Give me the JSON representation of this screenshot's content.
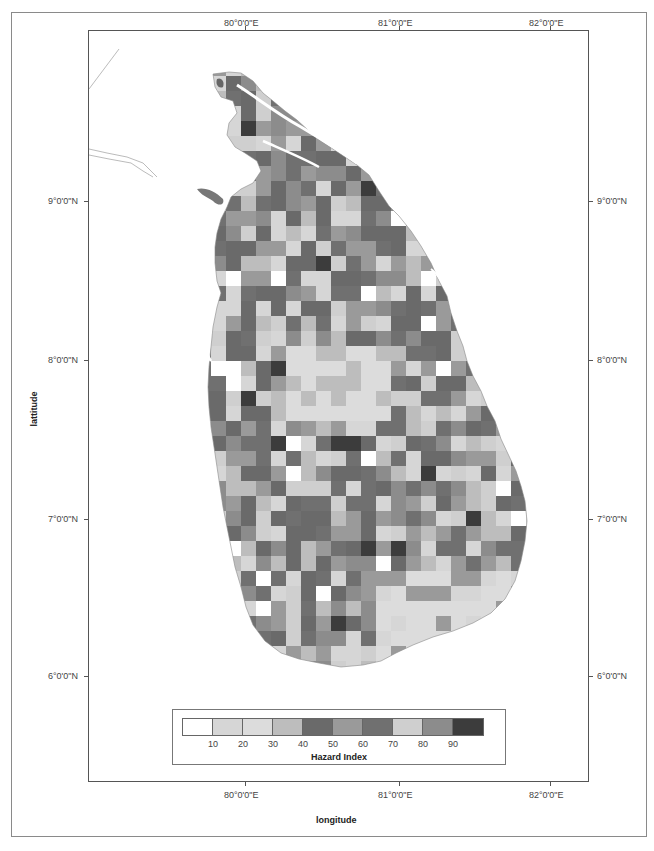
{
  "map": {
    "x_axis": {
      "title": "longitude",
      "ticks": [
        "80°0'0\"E",
        "81°0'0\"E",
        "82°0'0\"E"
      ]
    },
    "y_axis": {
      "title": "lattitude",
      "ticks": [
        "9°0'0\"N",
        "8°0'0\"N",
        "7°0'0\"N",
        "6°0'0\"N"
      ]
    },
    "legend": {
      "title": "Hazard Index",
      "tick_labels": [
        "10",
        "20",
        "30",
        "40",
        "50",
        "60",
        "70",
        "80",
        "90"
      ],
      "colors": [
        "#ffffff",
        "#d6d6d6",
        "#dcdcdc",
        "#bdbdbd",
        "#6a6a6a",
        "#9a9a9a",
        "#707070",
        "#cfcfcf",
        "#8c8c8c",
        "#3c3c3c"
      ]
    },
    "region": "Sri Lanka"
  }
}
